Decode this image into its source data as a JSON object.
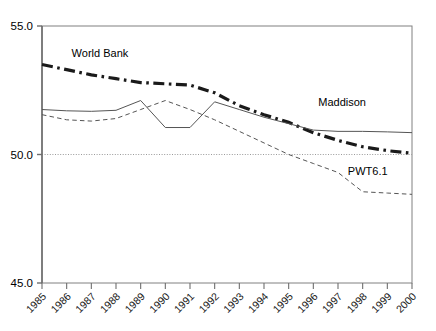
{
  "chart_data": {
    "type": "line",
    "title": "",
    "subtitle": "",
    "xlabel": "",
    "ylabel": "",
    "x": [
      1985,
      1986,
      1987,
      1988,
      1989,
      1990,
      1991,
      1992,
      1993,
      1994,
      1995,
      1996,
      1997,
      1998,
      1999,
      2000
    ],
    "categories": [
      "1985",
      "1986",
      "1987",
      "1988",
      "1989",
      "1990",
      "1991",
      "1992",
      "1993",
      "1994",
      "1995",
      "1996",
      "1997",
      "1998",
      "1999",
      "2000"
    ],
    "xlim": [
      1985,
      2000
    ],
    "ylim": [
      45.0,
      55.0
    ],
    "ytick_labels": [
      "55.0",
      "50.0",
      "45.0"
    ],
    "ytick_values": [
      55.0,
      50.0,
      45.0
    ],
    "grid": "horizontal-dotted-at-50",
    "legend": "inline-annotations",
    "series": [
      {
        "name": "World Bank",
        "style": "dash-dot",
        "color": "#1a1a1a",
        "width": 3.2,
        "label_x": 1986.2,
        "label_y": 53.95,
        "values": [
          53.5,
          53.3,
          53.1,
          52.95,
          52.8,
          52.75,
          52.7,
          52.4,
          51.9,
          51.55,
          51.25,
          50.85,
          50.55,
          50.3,
          50.15,
          50.05
        ]
      },
      {
        "name": "Maddison",
        "style": "solid",
        "color": "#555555",
        "width": 1.0,
        "label_x": 1996.2,
        "label_y": 52.05,
        "values": [
          51.75,
          51.7,
          51.68,
          51.72,
          52.1,
          51.05,
          51.05,
          52.05,
          51.75,
          51.45,
          51.2,
          50.95,
          50.9,
          50.9,
          50.88,
          50.85
        ]
      },
      {
        "name": "PWT6.1",
        "style": "dashed",
        "color": "#555555",
        "width": 1.0,
        "label_x": 1997.4,
        "label_y": 49.35,
        "values": [
          51.55,
          51.35,
          51.3,
          51.4,
          51.75,
          52.1,
          51.75,
          51.35,
          50.9,
          50.45,
          50.0,
          49.65,
          49.3,
          48.55,
          48.5,
          48.45
        ]
      }
    ]
  },
  "axes": {
    "y_labels": [
      "55.0",
      "50.0",
      "45.0"
    ],
    "x_labels": [
      "1985",
      "1986",
      "1987",
      "1988",
      "1989",
      "1990",
      "1991",
      "1992",
      "1993",
      "1994",
      "1995",
      "1996",
      "1997",
      "1998",
      "1999",
      "2000"
    ]
  },
  "annotations": {
    "world_bank": "World Bank",
    "maddison": "Maddison",
    "pwt": "PWT6.1"
  },
  "colors": {
    "frame": "#808080",
    "gridline": "#9a9a9a",
    "world_bank": "#1a1a1a",
    "maddison": "#555555",
    "pwt": "#555555",
    "text": "#000000"
  }
}
